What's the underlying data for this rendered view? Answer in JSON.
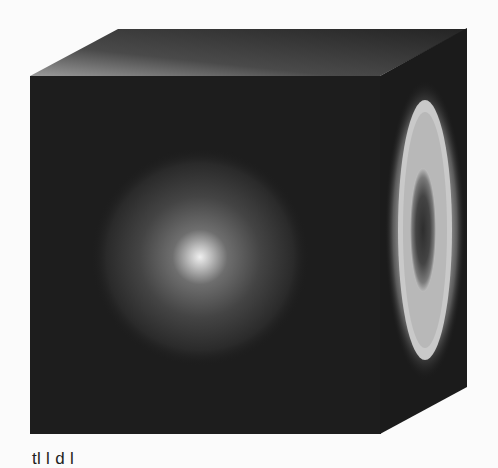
{
  "figure": {
    "colors": {
      "background": "#fbfbfb",
      "front_face": "#1c1c1c",
      "top_face_light": "#8a8a8a",
      "top_face_dark": "#2a2a2a",
      "glow_core": "#e8e8e8",
      "ring": "#c8c8c8",
      "ring_center": "#3a3a3a"
    },
    "caption_partial": "tl   l   d   l"
  }
}
